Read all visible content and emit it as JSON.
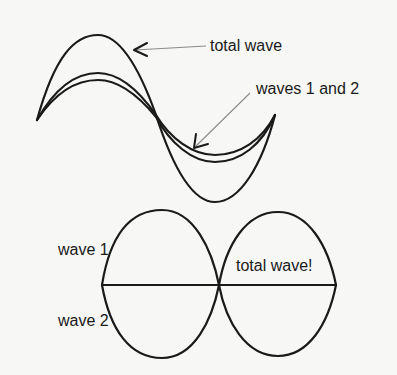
{
  "figure": {
    "background": "#f7f7f5",
    "ink": "#1a1a1a",
    "top_diagram": {
      "description": "Constructive interference: two nearly identical waves in phase add to a larger total wave",
      "labels": {
        "total_wave": "total wave",
        "waves_1_and_2": "waves 1 and 2"
      }
    },
    "bottom_diagram": {
      "description": "Destructive interference: two waves out of phase cancel to a flat total wave",
      "labels": {
        "wave_1": "wave 1",
        "wave_2": "wave 2",
        "total_wave": "total wave!"
      }
    }
  }
}
